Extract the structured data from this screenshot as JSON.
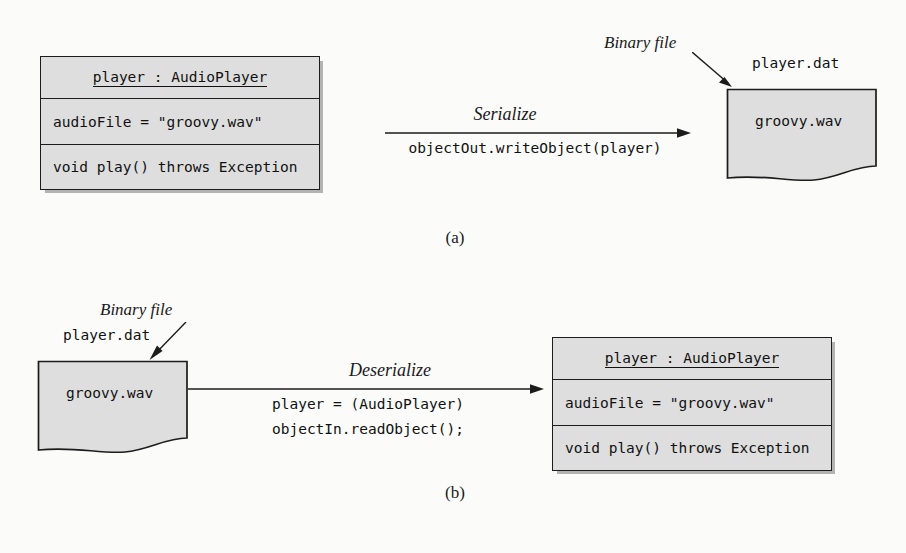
{
  "figure": {
    "background_color": "#fbfbfa",
    "shape_fill_color": "#dedede",
    "line_color": "#1c1c1c"
  },
  "panels": [
    {
      "id": "a",
      "caption": "(a)",
      "object_box": {
        "title": "player : AudioPlayer",
        "attribute": "audioFile = \"groovy.wav\"",
        "operation": "void play() throws Exception"
      },
      "transition": {
        "label": "Serialize",
        "code_lines": [
          "objectOut.writeObject(player)"
        ]
      },
      "file": {
        "name_label": "player.dat",
        "content_label": "groovy.wav",
        "callout": "Binary file"
      }
    },
    {
      "id": "b",
      "caption": "(b)",
      "object_box": {
        "title": "player : AudioPlayer",
        "attribute": "audioFile = \"groovy.wav\"",
        "operation": "void play() throws Exception"
      },
      "transition": {
        "label": "Deserialize",
        "code_lines": [
          "player = (AudioPlayer)",
          "objectIn.readObject();"
        ]
      },
      "file": {
        "name_label": "player.dat",
        "content_label": "groovy.wav",
        "callout": "Binary file"
      }
    }
  ]
}
